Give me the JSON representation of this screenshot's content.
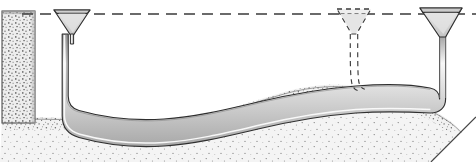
{
  "figure": {
    "caption": "Schematic cross-section showing three funnel intakes set at a common horizontal datum line, connected by a flexible conduit that descends, follows the contour of a granular sediment bed, and rises again at the right margin. The centre funnel and its descending limb are drawn with dashed outlines to indicate an alternative or removed position.",
    "width": 476,
    "height": 162
  },
  "colors": {
    "background": "#ffffff",
    "outline": "#2b2b2b",
    "datum_line": "#3a3a3a",
    "funnel_fill": "#d8d8d8",
    "funnel_fill_light": "#e9e9e9",
    "tube_fill": "#d2d2d2",
    "tube_highlight": "#f4f4f4",
    "sediment_fill": "#efefef",
    "sediment_stipple": "#6f6f6f",
    "sediment_edge": "#4a4a4a",
    "wall_fill": "#e6e6e6"
  },
  "elements": {
    "datum_line": {
      "label": "datum-line",
      "style": "dashed",
      "y": 14,
      "x_start": 22,
      "x_end": 476
    },
    "left_wall": {
      "label": "left-sediment-wall",
      "x": 2,
      "y": 11,
      "width": 33,
      "height": 110
    },
    "funnels": [
      {
        "id": "funnel-left",
        "label": "Left funnel intake",
        "style": "solid",
        "center_x": 72,
        "rim_y": 9,
        "rim_half_width": 18,
        "throat_y": 36,
        "stem_width": 5
      },
      {
        "id": "funnel-center",
        "label": "Centre funnel intake (alternate position)",
        "style": "dashed",
        "center_x": 354,
        "rim_y": 9,
        "rim_half_width": 17,
        "throat_y": 36,
        "stem_width": 6
      },
      {
        "id": "funnel-right",
        "label": "Right funnel intake",
        "style": "solid",
        "center_x": 441,
        "rim_y": 8,
        "rim_half_width": 21,
        "throat_y": 38,
        "stem_width": 6
      }
    ],
    "conduit": {
      "label": "flexible-conduit",
      "description": "Tube descending from the left funnel, sweeping along the sediment contour, and rising to the right funnel",
      "outer_width": 7
    },
    "sediment": {
      "label": "sediment-bed",
      "description": "Stippled granular bed with an undulating upper surface forming a trough on the left and a mound toward the right"
    },
    "corner_cut": {
      "label": "bottom-right-corner-cut",
      "description": "Diagonal edge truncating the lower-right corner of the section"
    }
  }
}
